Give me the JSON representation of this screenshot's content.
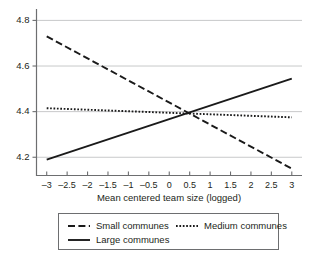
{
  "chart_data": {
    "type": "line",
    "title": "",
    "subtitle": "",
    "xlabel": "Mean centered team size (logged)",
    "ylabel": "",
    "xlim": [
      -3.25,
      3.25
    ],
    "ylim": [
      4.12,
      4.85
    ],
    "grid": true,
    "grid_axis": "y",
    "legend_position": "bottom",
    "x_ticks": [
      -3,
      -2.5,
      -2,
      -1.5,
      -1,
      -0.5,
      0,
      0.5,
      1,
      1.5,
      2,
      2.5,
      3
    ],
    "x_tick_labels": [
      "–3",
      "–2.5",
      "–2",
      "–1.5",
      "–1",
      "–0.5",
      "0",
      "0.5",
      "1",
      "1.5",
      "2",
      "2.5",
      "3"
    ],
    "y_ticks": [
      4.2,
      4.4,
      4.6,
      4.8
    ],
    "y_tick_labels": [
      "4.2",
      "4.4",
      "4.6",
      "4.8"
    ],
    "series": [
      {
        "name": "Small communes",
        "style": "dashed",
        "color": "#1a1a1a",
        "x": [
          -3,
          3
        ],
        "values": [
          4.73,
          4.15
        ]
      },
      {
        "name": "Medium communes",
        "style": "dotted",
        "color": "#1a1a1a",
        "x": [
          -3,
          3
        ],
        "values": [
          4.415,
          4.375
        ]
      },
      {
        "name": "Large communes",
        "style": "solid",
        "color": "#1a1a1a",
        "x": [
          -3,
          3
        ],
        "values": [
          4.19,
          4.545
        ]
      }
    ],
    "annotations": []
  },
  "legend": {
    "entries": [
      {
        "label": "Small communes",
        "style": "dashed"
      },
      {
        "label": "Medium communes",
        "style": "dotted"
      },
      {
        "label": "Large communes",
        "style": "solid"
      }
    ]
  }
}
